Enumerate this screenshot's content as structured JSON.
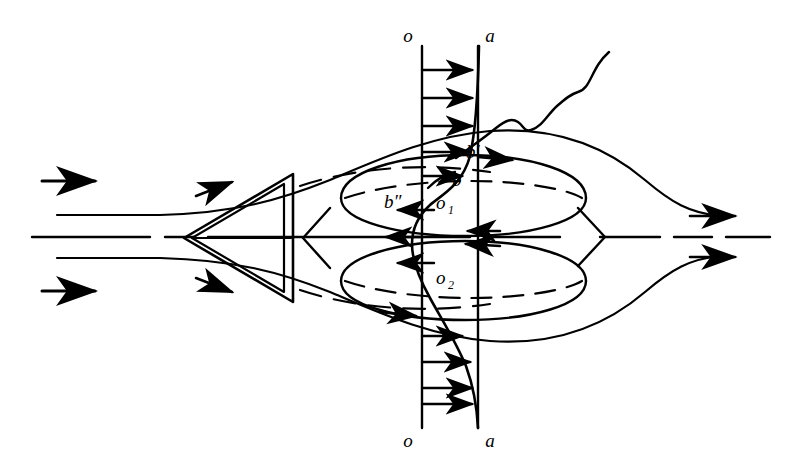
{
  "figure": {
    "kind": "fluid-flow-schematic",
    "background": "#ffffff",
    "stroke_color": "#000000",
    "width": 793,
    "height": 472
  },
  "labels": {
    "o_top": "o",
    "a_top": "a",
    "o_bottom": "o",
    "a_bottom": "a",
    "b_prime": "b′",
    "b": "b",
    "b_double_prime": "b″",
    "o1_base": "o",
    "o1_sub": "1",
    "o2_base": "o",
    "o2_sub": "2"
  },
  "elements": {
    "body": "triangular-wedge-double-outline",
    "vortex_ring_upper": "ellipse-upper",
    "vortex_ring_lower": "ellipse-lower",
    "section_line_oo": "vertical-line-o-o",
    "section_line_aa": "vertical-line-a-a",
    "velocity_profile": "s-shaped-curve",
    "wavy_ray": "wavy-line-upper-right",
    "axis": "dash-dot-centerline",
    "inflow_arrows": 2,
    "outflow_arrows": 2,
    "profile_arrows_forward_top": 5,
    "profile_arrows_reverse_middle": 3,
    "profile_arrows_forward_bottom": 5
  }
}
